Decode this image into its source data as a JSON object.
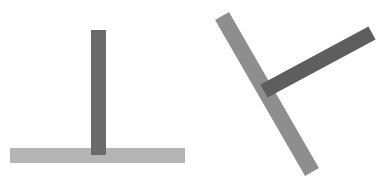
{
  "figures": [
    {
      "name": "upright-t",
      "horizontal_bar": {
        "x1": 10,
        "y1": 155.5,
        "x2": 185,
        "y2": 155.5,
        "width": 15,
        "color": "#b4b4b4"
      },
      "vertical_bar": {
        "x1": 98.5,
        "y1": 30,
        "x2": 98.5,
        "y2": 155,
        "width": 15,
        "color": "#6a6a6a"
      }
    },
    {
      "name": "rotated-t",
      "long_bar": {
        "x1": 222,
        "y1": 16,
        "x2": 312,
        "y2": 172,
        "width": 16,
        "color": "#8e8e8e"
      },
      "short_bar": {
        "x1": 264,
        "y1": 91,
        "x2": 372,
        "y2": 33,
        "width": 15,
        "color": "#5e5e5e"
      }
    }
  ]
}
